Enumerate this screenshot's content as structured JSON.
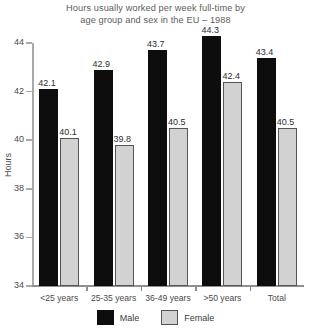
{
  "chart_data": {
    "type": "bar",
    "title": "Hours usually worked per week full-time by age group and sex in the EU – 1988",
    "title_lines": [
      "Hours usually worked per week full-time by",
      "age group and sex in the EU – 1988"
    ],
    "xlabel": "",
    "ylabel": "Hours",
    "ylim": [
      34,
      44
    ],
    "yticks": [
      34,
      36,
      38,
      40,
      42,
      44
    ],
    "ytick_labels": [
      "34",
      "36",
      "38",
      "40",
      "42",
      "44"
    ],
    "grid": false,
    "legend_position": "bottom",
    "categories": [
      "<25 years",
      "25-35 years",
      "36-49 years",
      ">50 years",
      "Total"
    ],
    "series": [
      {
        "name": "Male",
        "color": "#0d0d0d",
        "values": [
          42.1,
          42.9,
          43.7,
          44.3,
          43.4
        ],
        "labels": [
          "42.1",
          "42.9",
          "43.7",
          "44.3",
          "43.4"
        ]
      },
      {
        "name": "Female",
        "color": "#d2d2d2",
        "values": [
          40.1,
          39.8,
          40.5,
          42.4,
          40.5
        ],
        "labels": [
          "40.1",
          "39.8",
          "40.5",
          "42.4",
          "40.5"
        ]
      }
    ]
  },
  "colors": {
    "male": "#0d0d0d",
    "female": "#d2d2d2",
    "female_border": "#555555",
    "axis": "#a9a9a9",
    "text": "#4a4a4a",
    "background": "#ffffff"
  }
}
